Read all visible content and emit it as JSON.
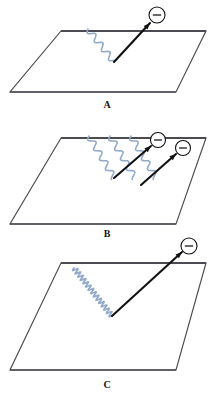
{
  "figure": {
    "background_color": "#ffffff",
    "width": 217,
    "height": 402,
    "surface_color": "#4b4b52",
    "photon_color": "#93aac9",
    "electron_color": "#111111",
    "label_color": "#141414"
  },
  "panels": [
    {
      "id": "A",
      "label": "A",
      "label_x": 107,
      "label_y": 108,
      "surface": {
        "name": "metal-surface-a",
        "points": "61,31 206,31 176,92 10,92"
      },
      "impact_point": {
        "x": 114,
        "y": 62
      },
      "photons": [
        {
          "name": "photon-wave-a-1",
          "start_x": 88,
          "start_y": 29,
          "amplitude": 3.0,
          "wavelength": 11.5,
          "stroke": 1.6
        }
      ],
      "electrons": [
        {
          "name": "electron-arrow-a-1",
          "tail_x": 114,
          "tail_y": 62,
          "head_x": 150,
          "head_y": 23,
          "circle_x": 157,
          "circle_y": 15,
          "circle_r": 8,
          "charge_symbol": "−"
        }
      ]
    },
    {
      "id": "B",
      "label": "B",
      "label_x": 107,
      "label_y": 237,
      "surface": {
        "name": "metal-surface-b",
        "points": "61,138 206,138 176,224 10,224"
      },
      "impact_point": {
        "x": 114,
        "y": 178
      },
      "photons": [
        {
          "name": "photon-wave-b-1",
          "start_x": 89,
          "start_y": 136,
          "amplitude": 3.0,
          "wavelength": 11.5,
          "stroke": 1.6
        },
        {
          "name": "photon-wave-b-2",
          "start_x": 110,
          "start_y": 136,
          "amplitude": 3.0,
          "wavelength": 11.5,
          "stroke": 1.6
        },
        {
          "name": "photon-wave-b-3",
          "start_x": 131,
          "start_y": 136,
          "amplitude": 3.0,
          "wavelength": 11.5,
          "stroke": 1.6
        }
      ],
      "electrons": [
        {
          "name": "electron-arrow-b-1",
          "tail_x": 114,
          "tail_y": 178,
          "head_x": 151,
          "head_y": 146,
          "circle_x": 158,
          "circle_y": 140,
          "circle_r": 7.5,
          "charge_symbol": "−"
        },
        {
          "name": "electron-arrow-b-2",
          "tail_x": 141,
          "tail_y": 185,
          "head_x": 176,
          "head_y": 154,
          "circle_x": 183,
          "circle_y": 148,
          "circle_r": 7.5,
          "charge_symbol": "−"
        }
      ]
    },
    {
      "id": "C",
      "label": "C",
      "label_x": 107,
      "label_y": 388,
      "surface": {
        "name": "metal-surface-c",
        "points": "61,263 206,263 176,370 10,370"
      },
      "impact_point": {
        "x": 112,
        "y": 316
      },
      "photons": [
        {
          "name": "photon-wave-c-1",
          "start_x": 74,
          "start_y": 268,
          "amplitude": 2.6,
          "wavelength": 4.2,
          "stroke": 1.7
        }
      ],
      "electrons": [
        {
          "name": "electron-arrow-c-1",
          "tail_x": 112,
          "tail_y": 316,
          "head_x": 182,
          "head_y": 252,
          "circle_x": 189,
          "circle_y": 246,
          "circle_r": 8,
          "charge_symbol": "−"
        }
      ]
    }
  ]
}
